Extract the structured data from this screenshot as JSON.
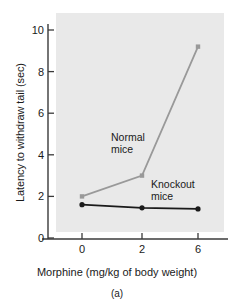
{
  "figure": {
    "caption": "(a)",
    "plot_bg_color": "#e9e9e9",
    "page_bg_color": "#ffffff",
    "axis_color": "#3a3a3a"
  },
  "chart_data": {
    "type": "line",
    "title": "",
    "xlabel": "Morphine (mg/kg of body weight)",
    "ylabel": "Latency to withdraw tail (sec)",
    "categories": [
      "0",
      "2",
      "6"
    ],
    "x": [
      0,
      2,
      6
    ],
    "xtick_labels": [
      "0",
      "2",
      "6"
    ],
    "ytick_labels": [
      "0",
      "2",
      "4",
      "6",
      "8",
      "10"
    ],
    "yticks": [
      0,
      2,
      4,
      6,
      8,
      10
    ],
    "ylim": [
      0,
      10.6
    ],
    "grid": false,
    "legend_position": "inline-annotations",
    "series": [
      {
        "name": "Normal mice",
        "label": "Normal\nmice",
        "color": "#999999",
        "marker": "square",
        "values": [
          2.0,
          3.0,
          9.2
        ]
      },
      {
        "name": "Knockout mice",
        "label": "Knockout\nmice",
        "color": "#1a1a1a",
        "marker": "circle",
        "values": [
          1.6,
          1.45,
          1.4
        ]
      }
    ],
    "annotations": [
      {
        "text": "Normal mice",
        "line1": "Normal",
        "line2": "mice"
      },
      {
        "text": "Knockout mice",
        "line1": "Knockout",
        "line2": "mice"
      }
    ]
  }
}
